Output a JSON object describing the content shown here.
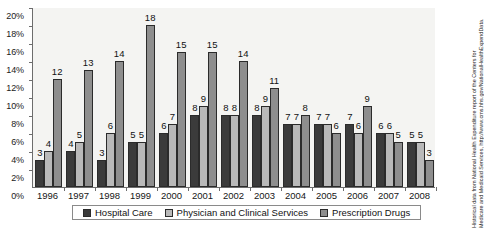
{
  "chart_data": {
    "type": "bar",
    "title": "",
    "xlabel": "",
    "ylabel": "",
    "ylim": [
      0,
      20
    ],
    "ytick_step": 2,
    "grid": false,
    "legend_position": "bottom",
    "categories": [
      "1996",
      "1997",
      "1998",
      "1999",
      "2000",
      "2001",
      "2002",
      "2003",
      "2004",
      "2005",
      "2006",
      "2007",
      "2008"
    ],
    "ytick_labels": [
      "0%",
      "2%",
      "4%",
      "6%",
      "8%",
      "10%",
      "12%",
      "14%",
      "16%",
      "18%",
      "20%"
    ],
    "series": [
      {
        "name": "Hospital Care",
        "color": "#3b3b3b",
        "values": [
          3,
          4,
          3,
          5,
          6,
          8,
          8,
          8,
          7,
          7,
          7,
          6,
          5
        ],
        "labels": [
          "3",
          "4",
          "3",
          "5",
          "6",
          "8",
          "8",
          "8",
          "7",
          "7",
          "7",
          "6",
          "5"
        ]
      },
      {
        "name": "Physician and Clinical Services",
        "color": "#b9b9b9",
        "values": [
          4,
          5,
          6,
          5,
          7,
          9,
          8,
          9,
          7,
          7,
          6,
          6,
          5
        ],
        "labels": [
          "4",
          "5",
          "6",
          "5",
          "7",
          "9",
          "8",
          "9",
          "7",
          "7",
          "6",
          "6",
          "5"
        ]
      },
      {
        "name": "Prescription Drugs",
        "color": "#8e8e8e",
        "values": [
          12,
          13,
          14,
          18,
          15,
          15,
          14,
          11,
          8,
          6,
          9,
          5,
          3
        ],
        "labels": [
          "12",
          "13",
          "14",
          "18",
          "15",
          "15",
          "14",
          "11",
          "8",
          "6",
          "9",
          "5",
          "3"
        ]
      }
    ],
    "source_note_line1": "Historical data from National Health Expenditure report of the Centers for",
    "source_note_line2": "Medicare and Medicaid Services, http://www.cms.hhs.gov/NationalHealthExpendData."
  }
}
